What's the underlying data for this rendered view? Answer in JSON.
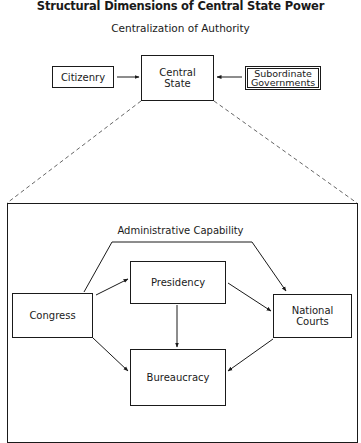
{
  "title": "Structural Dimensions of Central State Power",
  "subtitle": "Centralization of Authority",
  "top_level": {
    "nodes": [
      {
        "id": "citizenry",
        "label": "Citizenry"
      },
      {
        "id": "central_state",
        "label": "Central\nState"
      },
      {
        "id": "subordinate_governments",
        "label": "Subordinate\nGovernments"
      }
    ],
    "edges": [
      {
        "from": "citizenry",
        "to": "central_state",
        "style": "arrow"
      },
      {
        "from": "subordinate_governments",
        "to": "central_state",
        "style": "arrow"
      },
      {
        "from": "central_state",
        "to": "detail_frame",
        "style": "dashed-expansion"
      }
    ]
  },
  "detail": {
    "label": "Administrative Capability",
    "nodes": [
      {
        "id": "congress",
        "label": "Congress"
      },
      {
        "id": "presidency",
        "label": "Presidency"
      },
      {
        "id": "national_courts",
        "label": "National\nCourts"
      },
      {
        "id": "bureaucracy",
        "label": "Bureaucracy"
      }
    ],
    "edges": [
      {
        "from": "congress",
        "to": "national_courts",
        "style": "arrow-bent-over-top"
      },
      {
        "from": "congress",
        "to": "presidency",
        "style": "arrow"
      },
      {
        "from": "presidency",
        "to": "national_courts",
        "style": "arrow"
      },
      {
        "from": "presidency",
        "to": "bureaucracy",
        "style": "arrow"
      },
      {
        "from": "congress",
        "to": "bureaucracy",
        "style": "arrow"
      },
      {
        "from": "national_courts",
        "to": "bureaucracy",
        "style": "arrow"
      }
    ]
  },
  "colors": {
    "line": "#1a1a1a",
    "dashed": "#555555",
    "background": "#ffffff"
  }
}
